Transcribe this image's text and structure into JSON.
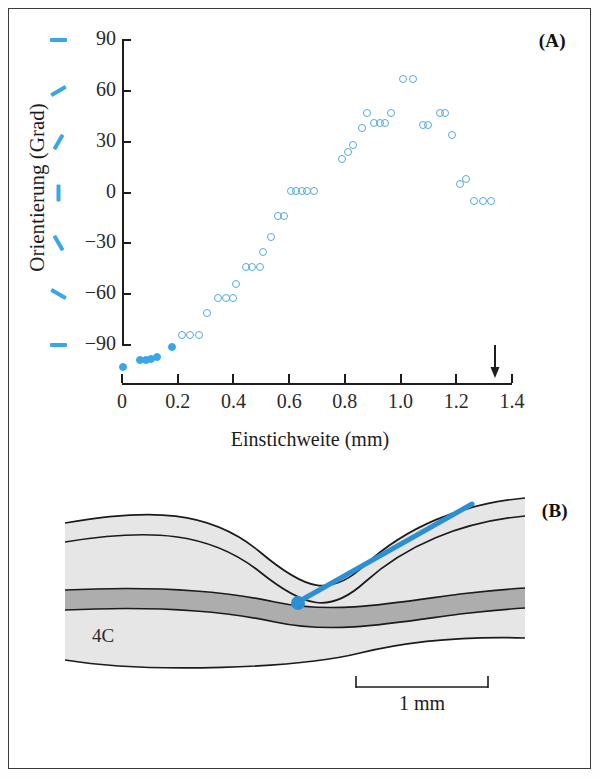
{
  "figure": {
    "panel_a_label": "(A)",
    "panel_b_label": "(B)"
  },
  "chart_data": {
    "type": "scatter",
    "title": "",
    "xlabel": "Einstichweite (mm)",
    "ylabel": "Orientierung (Grad)",
    "xlim": [
      0,
      1.4
    ],
    "ylim": [
      -105,
      90
    ],
    "xticks": [
      "0",
      "0.2",
      "0.4",
      "0.6",
      "0.8",
      "1.0",
      "1.2",
      "1.4"
    ],
    "xtick_values": [
      0,
      0.2,
      0.4,
      0.6,
      0.8,
      1.0,
      1.2,
      1.4
    ],
    "yticks": [
      "90",
      "60",
      "30",
      "0",
      "−30",
      "−60",
      "−90"
    ],
    "ytick_values": [
      90,
      60,
      30,
      0,
      -30,
      -60,
      -90
    ],
    "ytick_orientation_bars_deg": [
      90,
      60,
      30,
      0,
      -30,
      -60,
      -90
    ],
    "grid": false,
    "legend": "none",
    "marker_color": "#56a9e0",
    "filled_marker_color": "#3aa6e8",
    "series": [
      {
        "name": "filled",
        "marker": "filled-circle",
        "points": [
          [
            0.005,
            -103
          ],
          [
            0.065,
            -99
          ],
          [
            0.085,
            -99
          ],
          [
            0.105,
            -98
          ],
          [
            0.125,
            -97
          ],
          [
            0.18,
            -91
          ]
        ]
      },
      {
        "name": "open",
        "marker": "open-circle",
        "points": [
          [
            0.215,
            -84
          ],
          [
            0.245,
            -84
          ],
          [
            0.275,
            -84
          ],
          [
            0.305,
            -71
          ],
          [
            0.345,
            -62
          ],
          [
            0.375,
            -62
          ],
          [
            0.4,
            -62
          ],
          [
            0.41,
            -54
          ],
          [
            0.445,
            -44
          ],
          [
            0.465,
            -44
          ],
          [
            0.495,
            -44
          ],
          [
            0.505,
            -35
          ],
          [
            0.535,
            -26
          ],
          [
            0.56,
            -14
          ],
          [
            0.58,
            -14
          ],
          [
            0.605,
            1
          ],
          [
            0.625,
            1
          ],
          [
            0.645,
            1
          ],
          [
            0.665,
            1
          ],
          [
            0.69,
            1
          ],
          [
            0.79,
            20
          ],
          [
            0.81,
            24
          ],
          [
            0.83,
            28
          ],
          [
            0.86,
            38
          ],
          [
            0.88,
            47
          ],
          [
            0.905,
            41
          ],
          [
            0.925,
            41
          ],
          [
            0.945,
            41
          ],
          [
            0.965,
            47
          ],
          [
            1.01,
            67
          ],
          [
            1.045,
            67
          ],
          [
            1.08,
            40
          ],
          [
            1.1,
            40
          ],
          [
            1.14,
            47
          ],
          [
            1.16,
            47
          ],
          [
            1.185,
            34
          ],
          [
            1.215,
            5
          ],
          [
            1.235,
            8
          ],
          [
            1.265,
            -5
          ],
          [
            1.295,
            -5
          ],
          [
            1.325,
            -5
          ]
        ]
      }
    ],
    "annotations": [
      {
        "type": "down-arrow",
        "x": 1.34,
        "note": "end of penetration"
      }
    ]
  },
  "panel_b": {
    "layer_label": "4C",
    "scale_bar_label": "1 mm",
    "scale_bar_mm": 1,
    "track_color": "#2b8fd4",
    "recording_site_marker": "filled-circle"
  }
}
